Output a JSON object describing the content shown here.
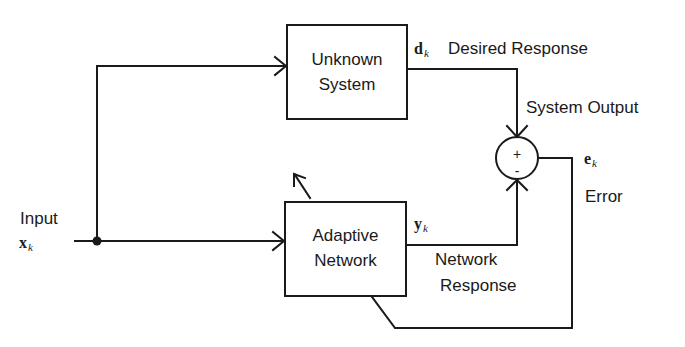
{
  "diagram": {
    "type": "block-diagram",
    "blocks": [
      {
        "id": "unknown-system",
        "lines": [
          "Unknown",
          "System"
        ]
      },
      {
        "id": "adaptive-network",
        "lines": [
          "Adaptive",
          "Network"
        ]
      }
    ],
    "summing_junction": {
      "plus": "+",
      "minus": "-"
    },
    "signals": {
      "input": {
        "label": "Input",
        "symbol": "x",
        "subscript": "k"
      },
      "desired": {
        "symbol": "d",
        "subscript": "k",
        "label": "Desired Response",
        "sublabel": "System Output"
      },
      "network_output": {
        "symbol": "y",
        "subscript": "k",
        "label_line1": "Network",
        "label_line2": "Response"
      },
      "error": {
        "symbol": "e",
        "subscript": "k",
        "label": "Error"
      }
    },
    "edges": [
      {
        "from": "input",
        "to": "unknown-system"
      },
      {
        "from": "input",
        "to": "adaptive-network"
      },
      {
        "from": "unknown-system",
        "to": "summing-junction",
        "sign": "+"
      },
      {
        "from": "adaptive-network",
        "to": "summing-junction",
        "sign": "-"
      },
      {
        "from": "summing-junction",
        "to": "adaptive-network",
        "kind": "error-feedback"
      }
    ],
    "colors": {
      "stroke": "#1a1a1a",
      "background": "#ffffff"
    }
  }
}
